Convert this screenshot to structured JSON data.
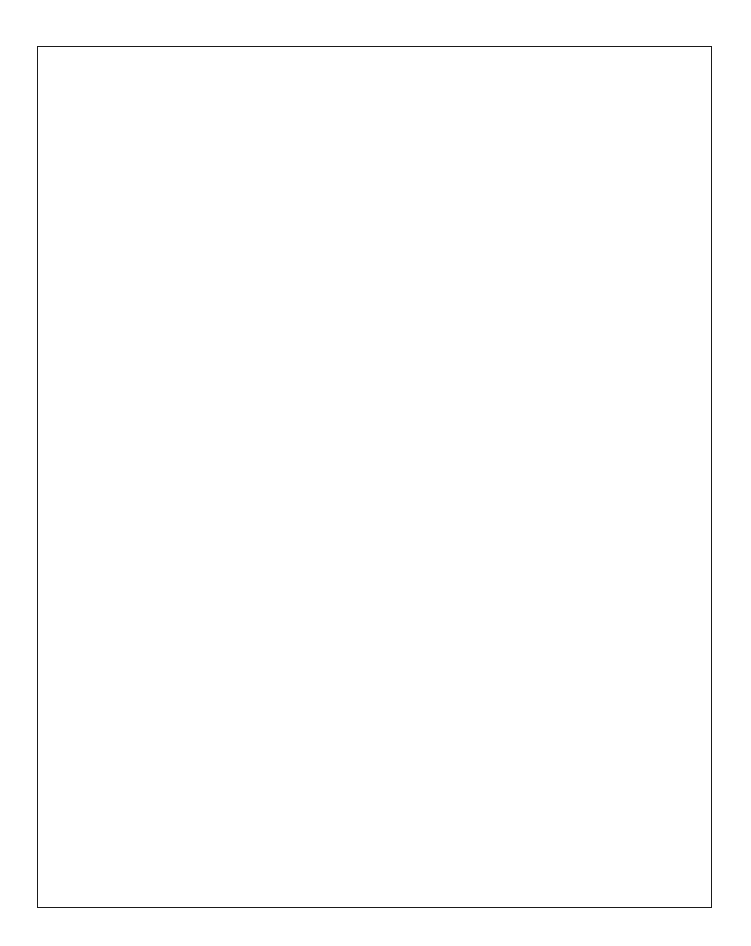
{
  "figure": {
    "kind": "medical-illustration",
    "technique": "pen-and-ink stipple / graphite shading, grayscale",
    "background_color": "#ffffff",
    "ink_color": "#000000",
    "border": {
      "color": "#1a1a1a",
      "width_px": 1.6,
      "x": 37,
      "y": 46,
      "w": 675,
      "h": 862
    }
  },
  "labels": [
    {
      "id": "needle",
      "name": "needle-insertion-label",
      "lines": [
        "Needle inserted",
        "at C6 level"
      ],
      "x": 162,
      "y": 459,
      "leader": {
        "from": [
          312,
          466
        ],
        "to": [
          417,
          470
        ]
      }
    },
    {
      "id": "anterior-scalene",
      "name": "anterior-scalene-label",
      "lines": [
        "Anterior scalene m."
      ],
      "x": 186,
      "y": 551,
      "leader": {
        "from": [
          330,
          550
        ],
        "to": [
          417,
          474
        ]
      }
    },
    {
      "id": "brachial-plexus",
      "name": "brachial-plexus-label",
      "lines": [
        "Brachial plexus"
      ],
      "x": 228,
      "y": 595,
      "leader": {
        "from": [
          345,
          593
        ],
        "to": [
          404,
          459
        ]
      }
    },
    {
      "id": "sternocleidomastoid",
      "name": "sternocleidomastoid-label",
      "lines": [
        "Lateral edge",
        "sternocleidomastoid m."
      ],
      "x": 495,
      "y": 588,
      "leader": {
        "from": [
          490,
          592
        ],
        "to": [
          470,
          500
        ]
      }
    }
  ],
  "anatomy": {
    "structures": [
      "head in lateral profile, neck extended",
      "ear (auricle)",
      "eyebrow and closed eye",
      "nose, lips, chin",
      "mandible",
      "sternocleidomastoid muscle (two bellies, reflected)",
      "anterior scalene muscle",
      "brachial plexus nerve roots",
      "clavicle",
      "first and second ribs",
      "manubrium of sternum",
      "trapezius / shoulder contour",
      "syringe with needle"
    ]
  },
  "instrument": {
    "name": "syringe",
    "barrel_graduations": true,
    "needle_tip_target": [
      420,
      468
    ]
  },
  "artifacts": {
    "scan_speck": {
      "x": 62,
      "y": 66,
      "w": 7,
      "h": 4,
      "color": "#d8d8d8"
    }
  }
}
